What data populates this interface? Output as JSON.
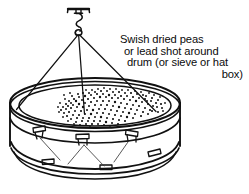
{
  "figure": {
    "title": "Swish dried peas or lead shot around drum",
    "background_color": "#ffffff",
    "ink_color": "#111111",
    "caption": {
      "lines": [
        "Swish dried peas",
        "or lead shot  around",
        "drum (or sieve or hat",
        "box)"
      ],
      "full_text": "Swish dried peas or lead shot around drum (or sieve or hat box)"
    },
    "parts": {
      "ceiling_bracket": "ceiling-bracket",
      "s_hook": "s-hook",
      "suspension_cords": 3,
      "drum": "drum-shell",
      "drum_head": "drum-head",
      "hoops": 2,
      "tension_lugs": 6,
      "grains_label": "dried peas or lead shot",
      "grain_count": 168
    }
  }
}
